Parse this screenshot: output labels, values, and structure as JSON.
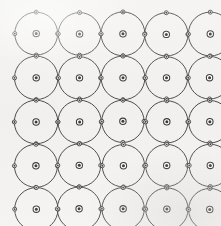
{
  "figure": {
    "name": "crystal-lattice-circle-packing",
    "caption": "",
    "width": 221,
    "height": 226
  },
  "canvas": {
    "background_color": "#f2f1ef",
    "line_color": "#1d1d1d",
    "node_fill": "#ffffff",
    "node_dot_color": "#141414"
  },
  "chart_data": {
    "type": "scatter",
    "title": "",
    "subtitle": "",
    "xlabel": "",
    "ylabel": "",
    "grid": false,
    "legend": null,
    "annotations": [],
    "lattice": {
      "rows": 5,
      "columns": 5,
      "circle_radius": 21.5,
      "spacing_x": 43.5,
      "spacing_y": 43.8,
      "origin_x": 36,
      "origin_y": 34,
      "center_ring_radius": 3.2,
      "center_dot_radius": 1.5,
      "edge_node_radius": 2.0,
      "edge_node_dot_radius": 0.95,
      "edge_node_angles_deg": [
        0,
        90,
        180,
        270
      ]
    },
    "xlim": [
      0,
      221
    ],
    "ylim": [
      0,
      226
    ],
    "series": [
      {
        "name": "circle-centers",
        "marker": "ringed-dot",
        "x": [
          36,
          79.5,
          123,
          166.5,
          210,
          36,
          79.5,
          123,
          166.5,
          210,
          36,
          79.5,
          123,
          166.5,
          210,
          36,
          79.5,
          123,
          166.5,
          210,
          36,
          79.5,
          123,
          166.5,
          210
        ],
        "y": [
          34,
          34,
          34,
          34,
          34,
          77.8,
          77.8,
          77.8,
          77.8,
          77.8,
          121.6,
          121.6,
          121.6,
          121.6,
          121.6,
          165.4,
          165.4,
          165.4,
          165.4,
          165.4,
          209.2,
          209.2,
          209.2,
          209.2,
          209.2
        ],
        "values": [
          1,
          1,
          1,
          1,
          1,
          1,
          1,
          1,
          1,
          1,
          1,
          1,
          1,
          1,
          1,
          1,
          1,
          1,
          1,
          1,
          1,
          1,
          1,
          1,
          1
        ]
      }
    ]
  }
}
